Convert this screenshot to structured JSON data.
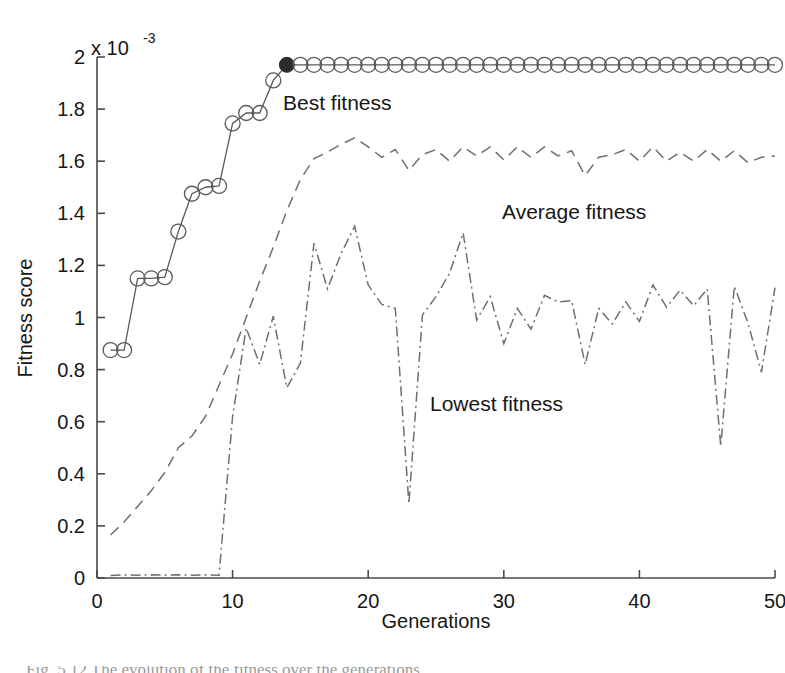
{
  "figure": {
    "background_color": "#ffffff",
    "axis_color": "#4a4a4a",
    "series_color": "#6b6b6b",
    "marker_fill_color": "#2b2b2b",
    "text_color": "#161616"
  },
  "axes": {
    "y_exponent_base": "x 10",
    "y_exponent_power": "-3",
    "y_label": "Fitness score",
    "x_label": "Generations",
    "x_ticks": [
      "0",
      "10",
      "20",
      "30",
      "40",
      "50"
    ],
    "y_ticks": [
      "0",
      "0.2",
      "0.4",
      "0.6",
      "0.8",
      "1",
      "1.2",
      "1.4",
      "1.6",
      "1.8",
      "2"
    ],
    "xlim": [
      0,
      50
    ],
    "ylim": [
      0,
      2
    ]
  },
  "annotations": {
    "best": "Best fitness",
    "average": "Average fitness",
    "lowest": "Lowest fitness"
  },
  "caption_fragment": "Fig. 5.12   The evolution of the fitness over the generations",
  "chart_data": {
    "type": "line",
    "title": "",
    "xlabel": "Generations",
    "ylabel": "Fitness score",
    "y_scale_exponent": -3,
    "xlim": [
      0,
      50
    ],
    "ylim": [
      0,
      2
    ],
    "grid": false,
    "legend": "inline-annotations",
    "x": [
      1,
      2,
      3,
      4,
      5,
      6,
      7,
      8,
      9,
      10,
      11,
      12,
      13,
      14,
      15,
      16,
      17,
      18,
      19,
      20,
      21,
      22,
      23,
      24,
      25,
      26,
      27,
      28,
      29,
      30,
      31,
      32,
      33,
      34,
      35,
      36,
      37,
      38,
      39,
      40,
      41,
      42,
      43,
      44,
      45,
      46,
      47,
      48,
      49,
      50
    ],
    "series": [
      {
        "name": "Best fitness",
        "style": "solid-with-circle-markers",
        "marker": "o",
        "highlight_index": 13,
        "values": [
          0.875,
          0.875,
          1.15,
          1.15,
          1.155,
          1.33,
          1.475,
          1.5,
          1.505,
          1.745,
          1.785,
          1.785,
          1.91,
          1.97,
          1.97,
          1.97,
          1.97,
          1.97,
          1.97,
          1.97,
          1.97,
          1.97,
          1.97,
          1.97,
          1.97,
          1.97,
          1.97,
          1.97,
          1.97,
          1.97,
          1.97,
          1.97,
          1.97,
          1.97,
          1.97,
          1.97,
          1.97,
          1.97,
          1.97,
          1.97,
          1.97,
          1.97,
          1.97,
          1.97,
          1.97,
          1.97,
          1.97,
          1.97,
          1.97,
          1.97
        ]
      },
      {
        "name": "Average fitness",
        "style": "dashed",
        "marker": "none",
        "values": [
          0.165,
          0.215,
          0.275,
          0.335,
          0.405,
          0.5,
          0.545,
          0.62,
          0.74,
          0.86,
          1.0,
          1.14,
          1.27,
          1.41,
          1.53,
          1.61,
          1.635,
          1.665,
          1.69,
          1.655,
          1.615,
          1.645,
          1.565,
          1.625,
          1.645,
          1.6,
          1.655,
          1.62,
          1.655,
          1.605,
          1.655,
          1.615,
          1.655,
          1.62,
          1.64,
          1.545,
          1.615,
          1.625,
          1.645,
          1.6,
          1.655,
          1.6,
          1.635,
          1.6,
          1.645,
          1.6,
          1.64,
          1.595,
          1.615,
          1.62
        ]
      },
      {
        "name": "Lowest fitness",
        "style": "dash-dot",
        "marker": "none",
        "values": [
          0.01,
          0.012,
          0.011,
          0.012,
          0.011,
          0.012,
          0.011,
          0.012,
          0.011,
          0.62,
          0.96,
          0.82,
          1.005,
          0.73,
          0.825,
          1.285,
          1.11,
          1.245,
          1.35,
          1.125,
          1.05,
          1.035,
          0.285,
          1.01,
          1.08,
          1.17,
          1.325,
          0.99,
          1.08,
          0.9,
          1.035,
          0.955,
          1.085,
          1.06,
          1.065,
          0.82,
          1.035,
          0.975,
          1.06,
          0.985,
          1.125,
          1.04,
          1.105,
          1.045,
          1.11,
          0.505,
          1.12,
          0.98,
          0.79,
          1.115
        ]
      }
    ]
  }
}
